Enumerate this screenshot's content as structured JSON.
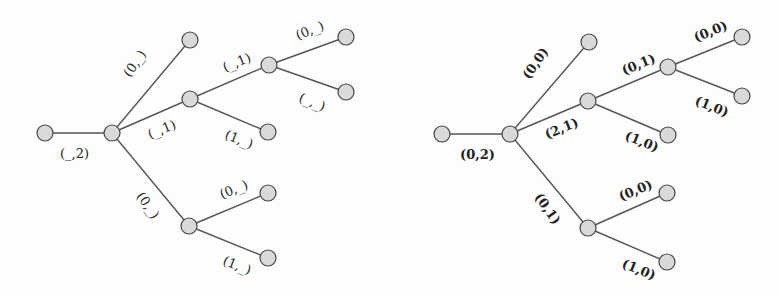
{
  "diagram": {
    "left_tree": {
      "nodes": [
        {
          "id": "L0",
          "x": 45,
          "y": 133
        },
        {
          "id": "L1",
          "x": 112,
          "y": 133
        },
        {
          "id": "L2",
          "x": 190,
          "y": 40
        },
        {
          "id": "L3",
          "x": 190,
          "y": 99
        },
        {
          "id": "L4",
          "x": 269,
          "y": 65
        },
        {
          "id": "L5",
          "x": 346,
          "y": 37
        },
        {
          "id": "L6",
          "x": 346,
          "y": 92
        },
        {
          "id": "L7",
          "x": 268,
          "y": 132
        },
        {
          "id": "L8",
          "x": 189,
          "y": 226
        },
        {
          "id": "L9",
          "x": 268,
          "y": 193
        },
        {
          "id": "L10",
          "x": 268,
          "y": 258
        }
      ],
      "edges": [
        {
          "from": "L0",
          "to": "L1",
          "label": "(_,2)",
          "lx": 60,
          "ly": 158,
          "rot": 0
        },
        {
          "from": "L1",
          "to": "L2",
          "label": "(0,_)",
          "lx": 130,
          "ly": 78,
          "rot": -55
        },
        {
          "from": "L1",
          "to": "L3",
          "label": "(_,1)",
          "lx": 150,
          "ly": 139,
          "rot": -22
        },
        {
          "from": "L3",
          "to": "L4",
          "label": "(_,1)",
          "lx": 225,
          "ly": 72,
          "rot": -22
        },
        {
          "from": "L4",
          "to": "L5",
          "label": "(0,_)",
          "lx": 298,
          "ly": 40,
          "rot": -22
        },
        {
          "from": "L4",
          "to": "L6",
          "label": "(_,_)",
          "lx": 298,
          "ly": 101,
          "rot": 22
        },
        {
          "from": "L3",
          "to": "L7",
          "label": "(1,_)",
          "lx": 224,
          "ly": 138,
          "rot": 22
        },
        {
          "from": "L1",
          "to": "L8",
          "label": "(0,_)",
          "lx": 136,
          "ly": 196,
          "rot": 55
        },
        {
          "from": "L8",
          "to": "L9",
          "label": "(0,_)",
          "lx": 222,
          "ly": 199,
          "rot": -22
        },
        {
          "from": "L8",
          "to": "L10",
          "label": "(1,_)",
          "lx": 222,
          "ly": 264,
          "rot": 22
        }
      ]
    },
    "right_tree": {
      "nodes": [
        {
          "id": "R0",
          "x": 442,
          "y": 134
        },
        {
          "id": "R1",
          "x": 510,
          "y": 134
        },
        {
          "id": "R2",
          "x": 589,
          "y": 42
        },
        {
          "id": "R3",
          "x": 588,
          "y": 101
        },
        {
          "id": "R4",
          "x": 668,
          "y": 67
        },
        {
          "id": "R5",
          "x": 742,
          "y": 37
        },
        {
          "id": "R6",
          "x": 742,
          "y": 96
        },
        {
          "id": "R7",
          "x": 668,
          "y": 135
        },
        {
          "id": "R8",
          "x": 588,
          "y": 228
        },
        {
          "id": "R9",
          "x": 667,
          "y": 193
        },
        {
          "id": "R10",
          "x": 667,
          "y": 262
        }
      ],
      "edges": [
        {
          "from": "R0",
          "to": "R1",
          "label": "(0,2)",
          "lx": 460,
          "ly": 159,
          "rot": 0
        },
        {
          "from": "R1",
          "to": "R2",
          "label": "(0,0)",
          "lx": 529,
          "ly": 80,
          "rot": -55
        },
        {
          "from": "R1",
          "to": "R3",
          "label": "(2,1)",
          "lx": 547,
          "ly": 139,
          "rot": -22
        },
        {
          "from": "R3",
          "to": "R4",
          "label": "(0,1)",
          "lx": 624,
          "ly": 75,
          "rot": -22
        },
        {
          "from": "R4",
          "to": "R5",
          "label": "(0,0)",
          "lx": 696,
          "ly": 42,
          "rot": -22
        },
        {
          "from": "R4",
          "to": "R6",
          "label": "(1,0)",
          "lx": 694,
          "ly": 104,
          "rot": 22
        },
        {
          "from": "R3",
          "to": "R7",
          "label": "(1,0)",
          "lx": 624,
          "ly": 139,
          "rot": 22
        },
        {
          "from": "R1",
          "to": "R8",
          "label": "(0,1)",
          "lx": 534,
          "ly": 197,
          "rot": 55
        },
        {
          "from": "R8",
          "to": "R9",
          "label": "(0,0)",
          "lx": 621,
          "ly": 201,
          "rot": -22
        },
        {
          "from": "R8",
          "to": "R10",
          "label": "(1,0)",
          "lx": 621,
          "ly": 267,
          "rot": 22
        }
      ]
    },
    "node_radius": 8,
    "colors": {
      "node_fill": "#d9d9d9",
      "node_stroke": "#444444",
      "edge": "#555555",
      "text": "#222222"
    }
  }
}
